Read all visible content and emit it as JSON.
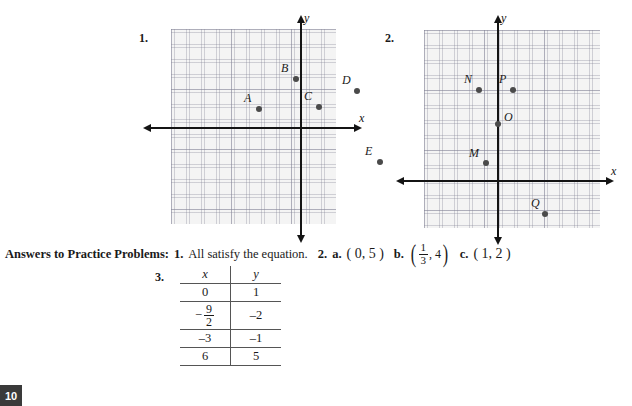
{
  "problems": [
    {
      "number": "1.",
      "axis_x_label": "x",
      "axis_y_label": "y",
      "points": [
        {
          "label": "A",
          "x": 88,
          "y": 80
        },
        {
          "label": "B",
          "x": 125,
          "y": 50
        },
        {
          "label": "C",
          "x": 148,
          "y": 78
        },
        {
          "label": "D",
          "x": 186,
          "y": 62
        },
        {
          "label": "E",
          "x": 209,
          "y": 133
        }
      ]
    },
    {
      "number": "2.",
      "axis_x_label": "x",
      "axis_y_label": "y",
      "points": [
        {
          "label": "M",
          "x": 62,
          "y": 133
        },
        {
          "label": "N",
          "x": 111,
          "y": 60
        },
        {
          "label": "O",
          "x": 130,
          "y": 94
        },
        {
          "label": "P",
          "x": 145,
          "y": 60
        },
        {
          "label": "Q",
          "x": 177,
          "y": 184
        }
      ]
    }
  ],
  "answers": {
    "heading": "Answers to Practice Problems:",
    "item1_num": "1.",
    "item1_text": "All satisfy the equation.",
    "item2_num": "2.",
    "part_a_label": "a.",
    "part_a_value": "( 0, 5 )",
    "part_b_label": "b.",
    "part_b_numerator": "1",
    "part_b_denominator": "3",
    "part_b_second": ", 4",
    "part_c_label": "c.",
    "part_c_value": "( 1, 2 )"
  },
  "table": {
    "number": "3.",
    "headers": [
      "x",
      "y"
    ],
    "rows": [
      {
        "x": "0",
        "y": "1",
        "fraction": false
      },
      {
        "x_num": "9",
        "x_den": "2",
        "x_sign": "−",
        "y": "–2",
        "fraction": true
      },
      {
        "x": "–3",
        "y": "–1",
        "fraction": false
      },
      {
        "x": "6",
        "y": "5",
        "fraction": false
      }
    ]
  },
  "page_number": "10",
  "colors": {
    "grid_bg": "#f4f4f4",
    "axis": "#141414",
    "point": "#4a4a4a"
  }
}
